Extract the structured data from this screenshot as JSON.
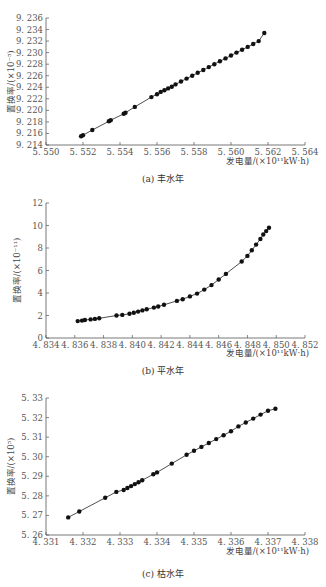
{
  "chart_data": [
    {
      "type": "scatter",
      "panel": "a",
      "title": "",
      "caption": "(a) 丰水年",
      "xlabel": "发电量/(×10¹¹kW·h)",
      "ylabel": "置换率/(×10⁻⁵)",
      "xlim": [
        5.55,
        5.564
      ],
      "ylim": [
        9.214,
        9.236
      ],
      "xticks": [
        "5.550",
        "5.552",
        "5.554",
        "5.556",
        "5.558",
        "5.560",
        "5.562",
        "5.564"
      ],
      "yticks": [
        "9.214",
        "9.216",
        "9.218",
        "9.220",
        "9.222",
        "9.224",
        "9.226",
        "9.228",
        "9.230",
        "9.232",
        "9.234",
        "9.236"
      ],
      "grid": false,
      "line": true,
      "series": [
        {
          "name": "丰水年",
          "x": [
            5.5519,
            5.552,
            5.5525,
            5.5534,
            5.5535,
            5.5542,
            5.5543,
            5.5548,
            5.5557,
            5.556,
            5.5562,
            5.5564,
            5.5566,
            5.5568,
            5.557,
            5.5573,
            5.5576,
            5.5579,
            5.5582,
            5.5585,
            5.5588,
            5.5591,
            5.5594,
            5.5597,
            5.56,
            5.5603,
            5.5606,
            5.5609,
            5.5612,
            5.5615,
            5.5618
          ],
          "y": [
            9.2155,
            9.2157,
            9.2166,
            9.2181,
            9.2183,
            9.2194,
            9.2196,
            9.2206,
            9.2223,
            9.2228,
            9.2232,
            9.2235,
            9.2238,
            9.2241,
            9.2245,
            9.225,
            9.2255,
            9.226,
            9.2265,
            9.227,
            9.2275,
            9.228,
            9.2285,
            9.229,
            9.2295,
            9.23,
            9.2305,
            9.231,
            9.2315,
            9.232,
            9.2334
          ]
        }
      ]
    },
    {
      "type": "scatter",
      "panel": "b",
      "title": "",
      "caption": "(b) 平水年",
      "xlabel": "发电量/(×10¹¹kW·h)",
      "ylabel": "置换率/(×10⁻¹¹)",
      "xlim": [
        4.834,
        4.852
      ],
      "ylim": [
        0,
        12
      ],
      "xticks": [
        "4.834",
        "4.836",
        "4.838",
        "4.840",
        "4.842",
        "4.844",
        "4.846",
        "4.848",
        "4.850",
        "4.852"
      ],
      "yticks": [
        "0",
        "2",
        "4",
        "6",
        "8",
        "10",
        "12"
      ],
      "grid": false,
      "line": true,
      "series": [
        {
          "name": "平水年",
          "x": [
            4.8362,
            4.8365,
            4.8367,
            4.8371,
            4.8374,
            4.8377,
            4.8389,
            4.8393,
            4.8398,
            4.8401,
            4.8404,
            4.8407,
            4.841,
            4.8415,
            4.8418,
            4.8422,
            4.8431,
            4.8435,
            4.844,
            4.8445,
            4.845,
            4.8455,
            4.846,
            4.8465,
            4.8476,
            4.848,
            4.8483,
            4.8486,
            4.8489,
            4.8491,
            4.8493,
            4.8495
          ],
          "y": [
            1.5,
            1.55,
            1.6,
            1.65,
            1.7,
            1.75,
            2.0,
            2.05,
            2.15,
            2.25,
            2.35,
            2.45,
            2.55,
            2.7,
            2.8,
            2.95,
            3.3,
            3.45,
            3.7,
            3.95,
            4.3,
            4.7,
            5.2,
            5.7,
            6.8,
            7.3,
            7.8,
            8.3,
            8.8,
            9.2,
            9.5,
            9.8
          ]
        }
      ]
    },
    {
      "type": "scatter",
      "panel": "c",
      "title": "",
      "caption": "(c) 枯水年",
      "xlabel": "发电量/(×10¹¹kW·h)",
      "ylabel": "置换率/(×10⁵)",
      "xlim": [
        4.331,
        4.338
      ],
      "ylim": [
        5.26,
        5.33
      ],
      "xticks": [
        "4.331",
        "4.332",
        "4.333",
        "4.334",
        "4.335",
        "4.336",
        "4.337",
        "4.338"
      ],
      "yticks": [
        "5.26",
        "5.27",
        "5.28",
        "5.29",
        "5.30",
        "5.31",
        "5.32",
        "5.33"
      ],
      "grid": false,
      "line": true,
      "series": [
        {
          "name": "枯水年",
          "x": [
            4.3316,
            4.3319,
            4.3326,
            4.3329,
            4.3331,
            4.3332,
            4.3333,
            4.3334,
            4.3335,
            4.3336,
            4.3339,
            4.334,
            4.3344,
            4.3348,
            4.335,
            4.3352,
            4.3354,
            4.3356,
            4.3358,
            4.336,
            4.3362,
            4.3364,
            4.3366,
            4.3368,
            4.337,
            4.3372
          ],
          "y": [
            5.269,
            5.272,
            5.279,
            5.282,
            5.283,
            5.284,
            5.285,
            5.286,
            5.287,
            5.288,
            5.291,
            5.292,
            5.2965,
            5.301,
            5.303,
            5.305,
            5.307,
            5.309,
            5.311,
            5.313,
            5.3155,
            5.3175,
            5.3195,
            5.3215,
            5.3235,
            5.3245
          ]
        }
      ]
    }
  ],
  "captions": {
    "a": "(a) 丰水年",
    "b": "(b) 平水年",
    "c": "(c) 枯水年"
  },
  "axis_titles": {
    "x": "发电量/(×10¹¹kW·h)",
    "y_a": "置换率/(×10⁻⁵)",
    "y_b": "置换率/(×10⁻¹¹)",
    "y_c": "置换率/(×10⁵)"
  },
  "colors": {
    "marker": "#111111",
    "line": "#222222",
    "axis": "#555555"
  }
}
